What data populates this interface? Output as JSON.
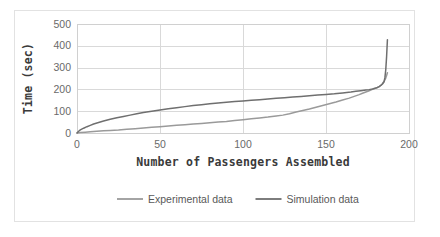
{
  "chart_data": {
    "type": "line",
    "title": "",
    "xlabel": "Number of Passengers Assembled",
    "ylabel": "Time (sec)",
    "xlim": [
      0,
      200
    ],
    "ylim": [
      0,
      500
    ],
    "xticks": [
      0,
      50,
      100,
      150,
      200
    ],
    "yticks": [
      0,
      100,
      200,
      300,
      400,
      500
    ],
    "grid": true,
    "legend_position": "bottom",
    "series": [
      {
        "name": "Experimental data",
        "color": "#9a9a9a",
        "x": [
          0,
          2,
          5,
          8,
          12,
          16,
          20,
          25,
          30,
          35,
          40,
          45,
          50,
          55,
          60,
          65,
          70,
          75,
          80,
          85,
          90,
          95,
          100,
          105,
          110,
          115,
          120,
          124,
          128,
          132,
          136,
          140,
          144,
          148,
          152,
          156,
          160,
          164,
          167,
          170,
          172,
          174,
          176,
          178,
          180,
          182,
          183,
          184,
          185,
          186,
          186.5,
          187
        ],
        "y": [
          0,
          2,
          4,
          6,
          8,
          10,
          12,
          14,
          17,
          20,
          23,
          26,
          29,
          32,
          35,
          38,
          41,
          44,
          47,
          50,
          53,
          57,
          61,
          65,
          69,
          73,
          78,
          82,
          88,
          96,
          103,
          110,
          118,
          126,
          134,
          142,
          151,
          160,
          168,
          176,
          182,
          188,
          194,
          200,
          206,
          212,
          218,
          226,
          238,
          252,
          264,
          276
        ]
      },
      {
        "name": "Simulation data",
        "color": "#6f6f6f",
        "x": [
          0,
          1,
          2,
          4,
          6,
          8,
          10,
          13,
          16,
          20,
          24,
          28,
          32,
          36,
          40,
          45,
          50,
          55,
          60,
          65,
          70,
          75,
          80,
          85,
          90,
          95,
          100,
          105,
          110,
          115,
          120,
          125,
          130,
          135,
          140,
          145,
          150,
          155,
          160,
          165,
          168,
          171,
          174,
          176,
          178,
          180,
          181,
          182,
          183,
          184,
          185,
          185.5,
          186,
          186.5,
          187
        ],
        "y": [
          0,
          8,
          14,
          22,
          29,
          35,
          41,
          48,
          55,
          63,
          70,
          76,
          82,
          88,
          94,
          100,
          106,
          111,
          116,
          121,
          126,
          130,
          134,
          138,
          141,
          144,
          147,
          150,
          153,
          156,
          159,
          162,
          165,
          168,
          171,
          174,
          177,
          180,
          184,
          188,
          191,
          194,
          197,
          199,
          202,
          206,
          209,
          213,
          218,
          225,
          235,
          255,
          290,
          350,
          428
        ]
      }
    ],
    "annotations": []
  },
  "legend": {
    "items": [
      {
        "label": "Experimental data",
        "color": "#9a9a9a"
      },
      {
        "label": "Simulation data",
        "color": "#6f6f6f"
      }
    ]
  },
  "axes": {
    "x_title": "Number of Passengers Assembled",
    "y_title": "Time (sec)",
    "x_tick_labels": [
      "0",
      "50",
      "100",
      "150",
      "200"
    ],
    "y_tick_labels": [
      "0",
      "100",
      "200",
      "300",
      "400",
      "500"
    ]
  },
  "colors": {
    "grid": "#d9d9d9",
    "frame_border": "#e2e2e2",
    "plot_border": "#d0d0d0",
    "tick_text": "#6a6a6a",
    "title_text": "#3a3a3a",
    "background": "#ffffff"
  }
}
